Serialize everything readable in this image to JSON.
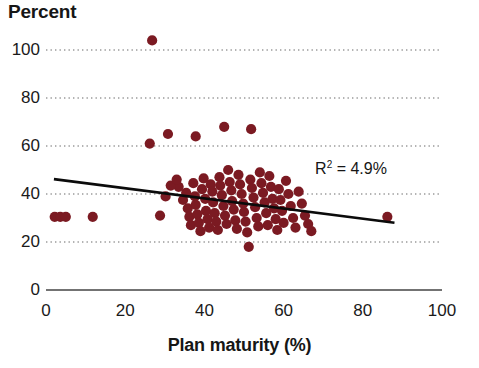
{
  "chart_data": {
    "type": "scatter",
    "title": "",
    "ylabel": "Percent",
    "xlabel": "Plan maturity (%)",
    "xlim": [
      0,
      100
    ],
    "ylim": [
      0,
      110
    ],
    "xticks": [
      0,
      20,
      40,
      60,
      80,
      100
    ],
    "yticks": [
      0,
      20,
      40,
      60,
      80,
      100
    ],
    "xtick_labels": [
      "0",
      "20",
      "40",
      "60",
      "80",
      "100"
    ],
    "ytick_labels": [
      "0",
      "20",
      "40",
      "60",
      "80",
      "100"
    ],
    "grid": "horizontal dotted gridlines at each y tick",
    "legend": "none",
    "marker_color": "#7b1a22",
    "trendline_color": "#0b0b0b",
    "annotations": [
      {
        "text_prefix": "R",
        "superscript": "2",
        "text_suffix": " = 4.9%",
        "full_text": "R2 = 4.9%",
        "x": 72,
        "y": 50
      }
    ],
    "trendline": {
      "x": [
        2,
        88
      ],
      "y": [
        46.2,
        28.0
      ]
    },
    "points": [
      [
        2.2,
        30.5
      ],
      [
        3.6,
        30.5
      ],
      [
        5.0,
        30.5
      ],
      [
        11.8,
        30.5
      ],
      [
        26.8,
        104.0
      ],
      [
        26.2,
        61.0
      ],
      [
        30.8,
        65.0
      ],
      [
        37.8,
        64.0
      ],
      [
        45.0,
        68.0
      ],
      [
        51.8,
        67.0
      ],
      [
        33.5,
        43.0
      ],
      [
        34.6,
        37.5
      ],
      [
        35.4,
        40.5
      ],
      [
        35.8,
        34.0
      ],
      [
        36.2,
        30.5
      ],
      [
        36.6,
        27.0
      ],
      [
        37.2,
        44.5
      ],
      [
        37.6,
        39.0
      ],
      [
        37.8,
        35.5
      ],
      [
        38.2,
        31.5
      ],
      [
        38.6,
        28.0
      ],
      [
        39.0,
        24.5
      ],
      [
        39.4,
        42.0
      ],
      [
        39.8,
        46.5
      ],
      [
        40.2,
        38.0
      ],
      [
        40.4,
        33.0
      ],
      [
        40.8,
        29.5
      ],
      [
        41.2,
        26.0
      ],
      [
        41.6,
        44.0
      ],
      [
        42.0,
        41.0
      ],
      [
        42.2,
        36.5
      ],
      [
        42.6,
        32.0
      ],
      [
        43.0,
        28.5
      ],
      [
        43.4,
        25.0
      ],
      [
        43.8,
        47.0
      ],
      [
        44.0,
        43.5
      ],
      [
        44.4,
        39.5
      ],
      [
        44.8,
        35.0
      ],
      [
        45.2,
        31.0
      ],
      [
        45.6,
        27.5
      ],
      [
        46.0,
        50.0
      ],
      [
        46.4,
        45.0
      ],
      [
        46.8,
        41.5
      ],
      [
        47.0,
        37.0
      ],
      [
        47.4,
        33.5
      ],
      [
        47.8,
        29.0
      ],
      [
        48.2,
        25.5
      ],
      [
        48.6,
        48.0
      ],
      [
        49.0,
        44.0
      ],
      [
        49.4,
        40.0
      ],
      [
        49.8,
        36.0
      ],
      [
        50.0,
        32.5
      ],
      [
        50.4,
        28.5
      ],
      [
        50.8,
        24.0
      ],
      [
        51.2,
        18.0
      ],
      [
        51.6,
        46.0
      ],
      [
        52.0,
        42.5
      ],
      [
        52.4,
        38.5
      ],
      [
        52.8,
        34.5
      ],
      [
        53.2,
        30.0
      ],
      [
        53.6,
        26.5
      ],
      [
        54.0,
        49.0
      ],
      [
        54.4,
        44.5
      ],
      [
        54.8,
        40.5
      ],
      [
        55.2,
        36.5
      ],
      [
        55.6,
        32.0
      ],
      [
        56.0,
        27.0
      ],
      [
        56.4,
        47.5
      ],
      [
        56.8,
        43.0
      ],
      [
        57.2,
        38.0
      ],
      [
        57.6,
        34.0
      ],
      [
        58.0,
        29.5
      ],
      [
        58.4,
        25.0
      ],
      [
        58.8,
        42.0
      ],
      [
        59.2,
        37.5
      ],
      [
        59.6,
        33.0
      ],
      [
        60.0,
        28.0
      ],
      [
        60.6,
        45.5
      ],
      [
        61.2,
        40.0
      ],
      [
        61.8,
        35.0
      ],
      [
        62.4,
        30.0
      ],
      [
        63.0,
        26.0
      ],
      [
        63.8,
        41.0
      ],
      [
        64.6,
        36.0
      ],
      [
        65.4,
        31.0
      ],
      [
        66.2,
        27.5
      ],
      [
        67.0,
        24.5
      ],
      [
        31.5,
        43.5
      ],
      [
        33.0,
        46.0
      ],
      [
        30.2,
        39.0
      ],
      [
        28.8,
        31.0
      ],
      [
        86.2,
        30.5
      ]
    ]
  },
  "chart_meta": {
    "y_axis_title": "Percent",
    "x_axis_title": "Plan maturity (%)",
    "r2_label_r": "R",
    "r2_label_sup": "2",
    "r2_label_rest": " = 4.9%"
  }
}
